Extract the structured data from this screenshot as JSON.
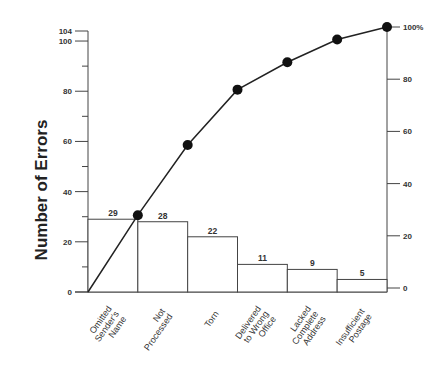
{
  "chart_data": {
    "type": "bar",
    "subtype": "pareto",
    "title": "",
    "xlabel": "",
    "ylabel": "Number of Errors",
    "ylim": [
      0,
      104
    ],
    "y2lim": [
      0,
      100
    ],
    "categories": [
      "Omitted Sender's Name",
      "Not Processed",
      "Torn",
      "Delivered to Wrong Office",
      "Lacked Complete Address",
      "Insufficient Postage"
    ],
    "category_lines": [
      [
        "Omitted",
        "Sender's",
        "Name"
      ],
      [
        "Not",
        "Processed"
      ],
      [
        "Torn"
      ],
      [
        "Delivered",
        "to Wrong",
        "Office"
      ],
      [
        "Lacked",
        "Complete",
        "Address"
      ],
      [
        "Insufficient",
        "Postage"
      ]
    ],
    "series": [
      {
        "name": "Number of Errors",
        "type": "bar",
        "values": [
          29,
          28,
          22,
          11,
          9,
          5
        ]
      },
      {
        "name": "Cumulative Percent",
        "type": "line",
        "values": [
          27.9,
          54.8,
          76.0,
          86.5,
          95.2,
          100
        ]
      }
    ],
    "left_ticks": [
      "0",
      "20",
      "40",
      "60",
      "80",
      "100",
      "104"
    ],
    "left_tick_values": [
      0,
      20,
      40,
      60,
      80,
      100,
      104
    ],
    "right_ticks": [
      "0",
      "20",
      "40",
      "60",
      "80",
      "100%"
    ],
    "right_tick_values": [
      0,
      20,
      40,
      60,
      80,
      100
    ],
    "grid": false,
    "legend": null
  }
}
